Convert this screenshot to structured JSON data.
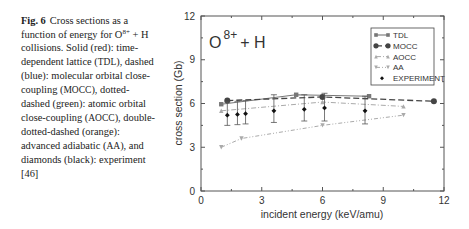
{
  "caption": {
    "label": "Fig. 6",
    "text_parts": [
      "Cross sections as a function of energy for O",
      "8+",
      " + H collisions. Solid (red): time-dependent lattice (",
      "TDL",
      "), dashed (blue): molecular orbital close-coupling (",
      "MOCC",
      "), dotted-dashed (green): atomic orbital close-coupling (",
      "AOCC",
      "), double-dotted-dashed (orange): advanced adiabatic (",
      "AA",
      "), and diamonds (black): experiment [46]"
    ]
  },
  "chart_data": {
    "type": "line",
    "title": "",
    "annotation": {
      "base": "O",
      "superscript": "8+",
      "suffix": "+ H"
    },
    "xlabel": "incident energy (keV/amu)",
    "ylabel": "cross section (Gb)",
    "xlim": [
      0,
      12
    ],
    "ylim": [
      0,
      12
    ],
    "xticks": [
      0,
      3,
      6,
      9,
      12
    ],
    "yticks": [
      0,
      3,
      6,
      9,
      12
    ],
    "grid": false,
    "legend_position": "upper right",
    "series": [
      {
        "name": "TDL",
        "marker": "square",
        "style": "solid",
        "x": [
          1.0,
          4.7,
          8.3
        ],
        "y": [
          5.95,
          6.6,
          6.5
        ]
      },
      {
        "name": "MOCC",
        "marker": "circle",
        "style": "dashed",
        "x": [
          1.3,
          6.0,
          11.5
        ],
        "y": [
          6.2,
          6.45,
          6.15
        ]
      },
      {
        "name": "AOCC",
        "marker": "triangle-up",
        "style": "dash-dot",
        "x": [
          1.0,
          6.0,
          10.0
        ],
        "y": [
          5.5,
          6.1,
          5.8
        ]
      },
      {
        "name": "AA",
        "marker": "triangle-down",
        "style": "dash-dot-dot",
        "x": [
          1.0,
          2.0,
          6.0,
          10.0
        ],
        "y": [
          3.0,
          3.6,
          4.5,
          5.2
        ]
      },
      {
        "name": "EXPERIMENT",
        "marker": "diamond",
        "style": "none",
        "x": [
          1.3,
          1.8,
          2.2,
          3.6,
          5.1,
          6.1,
          8.1
        ],
        "y": [
          5.2,
          5.25,
          5.3,
          5.5,
          5.6,
          5.7,
          5.5
        ],
        "err_low": [
          0.7,
          0.7,
          0.7,
          0.8,
          0.8,
          0.9,
          0.9
        ],
        "err_high": [
          0.9,
          0.9,
          0.9,
          1.1,
          1.0,
          1.0,
          1.0
        ]
      }
    ]
  },
  "colors": {
    "axis": "#555555",
    "tdl": "#777777",
    "mocc": "#444444",
    "aocc": "#aaaaaa",
    "aa": "#aaaaaa",
    "experiment": "#111111"
  }
}
